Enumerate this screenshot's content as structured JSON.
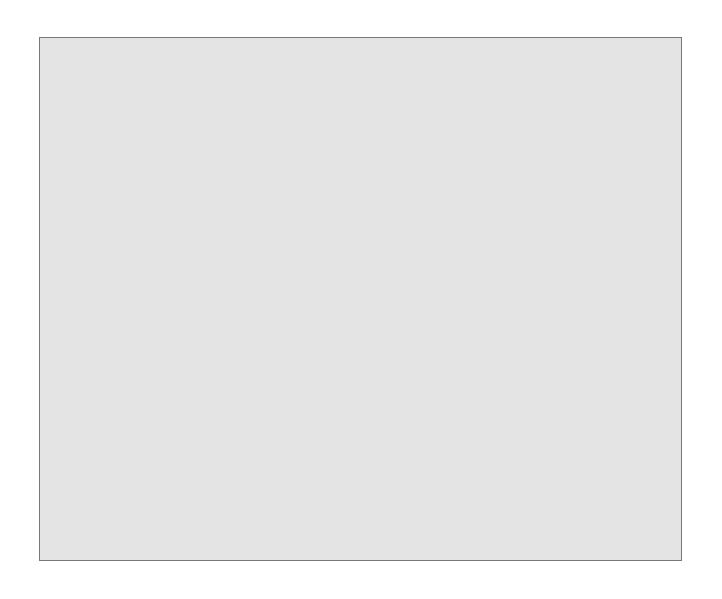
{
  "chart_data": {
    "type": "bar",
    "style": "3d",
    "title": "",
    "xlabel": "",
    "ylabel": "Anteil der antwortenden Mitarbeiter",
    "ylim": [
      0,
      60
    ],
    "yticks": [
      "0,0%",
      "10,0%",
      "20,0%",
      "30,0%",
      "40,0%",
      "50,0%",
      "60,0%"
    ],
    "categories": [
      "niedrig, mit weniger als 25% der Patienten",
      "mittel, mit etwa 50% der Patienten",
      "hoch, mit mehr als 75% der Patienten"
    ],
    "category_lines": [
      [
        "niedrig, mit weniger",
        "als 25% der Patienten"
      ],
      [
        "mittel, mit etwa 50%",
        "der Patienten"
      ],
      [
        "hoch, mit mehr als 75%",
        "der Patienten"
      ]
    ],
    "values": [
      13.3,
      30.0,
      56.7
    ],
    "counts": [
      4,
      9,
      17
    ],
    "data_labels": [
      {
        "pct": "13,3%",
        "n": "4"
      },
      {
        "pct": "30,0%",
        "n": "9"
      },
      {
        "pct": "56,7%",
        "n": "17"
      }
    ],
    "grid": false,
    "legend": null
  },
  "colors": {
    "frame_bg": "#e4e4e4",
    "wall": "#8c8c8c",
    "wall_side": "#555555",
    "bar_front": "#a8a8a8",
    "bar_top": "#5e5e5e",
    "bar_side": "#444444"
  }
}
